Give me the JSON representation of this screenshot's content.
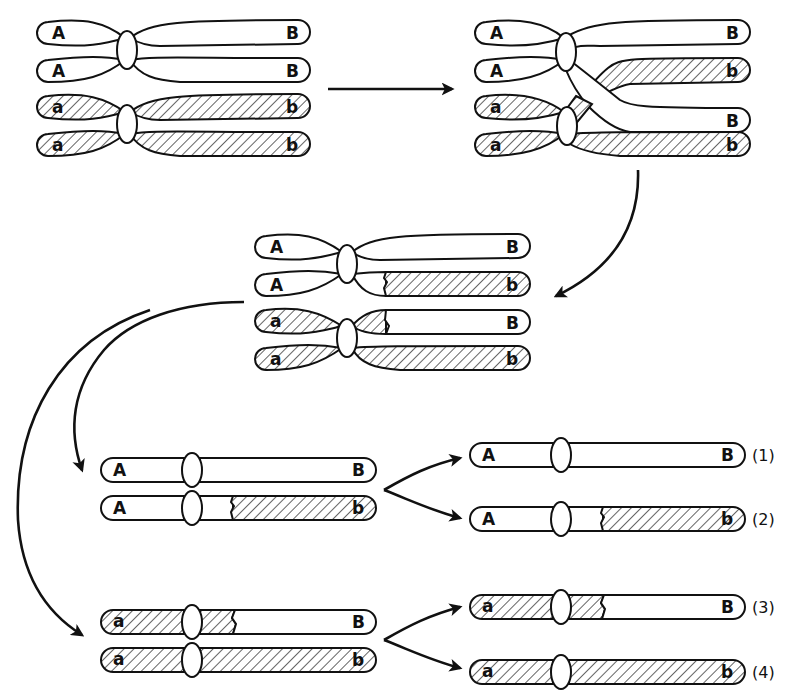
{
  "diagram": {
    "colors": {
      "line": "#111111",
      "background": "#ffffff",
      "hatch": "#111111"
    },
    "stages": [
      {
        "id": "stage-1-tetrad",
        "description": "Paired homologs before crossing over",
        "chromatids": [
          {
            "left": "A",
            "right": "B",
            "left_fill": "white",
            "right_fill": "white"
          },
          {
            "left": "A",
            "right": "B",
            "left_fill": "white",
            "right_fill": "white"
          },
          {
            "left": "a",
            "right": "b",
            "left_fill": "hatched",
            "right_fill": "hatched"
          },
          {
            "left": "a",
            "right": "b",
            "left_fill": "hatched",
            "right_fill": "hatched"
          }
        ]
      },
      {
        "id": "stage-2-crossover",
        "description": "Chiasma: non-sister chromatids cross over",
        "chromatids": [
          {
            "left": "A",
            "right": "B"
          },
          {
            "left": "A",
            "right": "b"
          },
          {
            "left": "a",
            "right": "B"
          },
          {
            "left": "a",
            "right": "b"
          }
        ]
      },
      {
        "id": "stage-3-recombined",
        "description": "Exchanged segments after crossing over",
        "chromatids": [
          {
            "left": "A",
            "right": "B"
          },
          {
            "left": "A",
            "right": "b"
          },
          {
            "left": "a",
            "right": "B"
          },
          {
            "left": "a",
            "right": "b"
          }
        ]
      },
      {
        "id": "stage-4-meiosis-I",
        "description": "Separation of homologs",
        "pairs": [
          [
            {
              "left": "A",
              "right": "B"
            },
            {
              "left": "A",
              "right": "b"
            }
          ],
          [
            {
              "left": "a",
              "right": "B"
            },
            {
              "left": "a",
              "right": "b"
            }
          ]
        ]
      },
      {
        "id": "stage-5-gametes",
        "description": "Products of meiosis II",
        "gametes": [
          {
            "left": "A",
            "right": "B",
            "number": "(1)",
            "type": "parental"
          },
          {
            "left": "A",
            "right": "b",
            "number": "(2)",
            "type": "recombinant"
          },
          {
            "left": "a",
            "right": "B",
            "number": "(3)",
            "type": "recombinant"
          },
          {
            "left": "a",
            "right": "b",
            "number": "(4)",
            "type": "parental"
          }
        ]
      }
    ],
    "labels": {
      "s1": [
        "A",
        "B",
        "A",
        "B",
        "a",
        "b",
        "a",
        "b"
      ],
      "s2": [
        "A",
        "B",
        "A",
        "b",
        "a",
        "B",
        "a",
        "b"
      ],
      "s3": [
        "A",
        "B",
        "A",
        "b",
        "a",
        "B",
        "a",
        "b"
      ],
      "s4": [
        "A",
        "B",
        "A",
        "b",
        "a",
        "B",
        "a",
        "b"
      ],
      "s5": [
        "A",
        "B",
        "A",
        "b",
        "a",
        "B",
        "a",
        "b"
      ],
      "numbers": [
        "(1)",
        "(2)",
        "(3)",
        "(4)"
      ]
    },
    "arrows": [
      {
        "from": "stage-1-tetrad",
        "to": "stage-2-crossover",
        "direction": "right"
      },
      {
        "from": "stage-2-crossover",
        "to": "stage-3-recombined",
        "direction": "curved-down-left"
      },
      {
        "from": "stage-3-recombined",
        "to": "stage-4-meiosis-I pair AB/Ab",
        "direction": "curved-down"
      },
      {
        "from": "stage-3-recombined",
        "to": "stage-4-meiosis-I pair aB/ab",
        "direction": "curved-down"
      },
      {
        "from": "pair AB/Ab",
        "to": "gamete (1)"
      },
      {
        "from": "pair AB/Ab",
        "to": "gamete (2)"
      },
      {
        "from": "pair aB/ab",
        "to": "gamete (3)"
      },
      {
        "from": "pair aB/ab",
        "to": "gamete (4)"
      }
    ]
  }
}
